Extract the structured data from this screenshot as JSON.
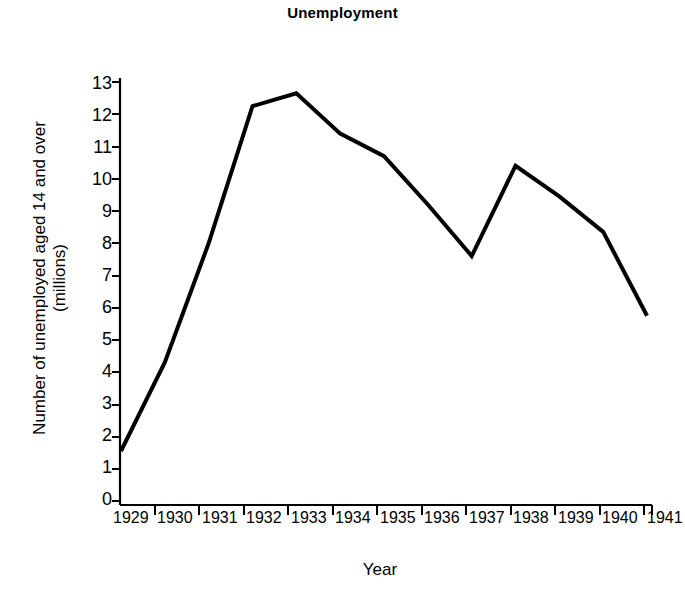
{
  "chart_data": {
    "type": "line",
    "title": "Unemployment",
    "xlabel": "Year",
    "ylabel": "Number of unemployed aged 14 and over (millions)",
    "ylabel_lines": [
      "Number of unemployed aged 14 and over",
      "(millions)"
    ],
    "categories": [
      "1929",
      "1930",
      "1931",
      "1932",
      "1933",
      "1934",
      "1935",
      "1936",
      "1937",
      "1938",
      "1939",
      "1940",
      "1941"
    ],
    "values": [
      1.55,
      4.3,
      8.0,
      12.25,
      12.65,
      11.4,
      10.7,
      9.2,
      7.6,
      10.4,
      9.45,
      8.35,
      5.75
    ],
    "series": [
      {
        "name": "Number of unemployed aged 14 and over (millions)",
        "values": [
          1.55,
          4.3,
          8.0,
          12.25,
          12.65,
          11.4,
          10.7,
          9.2,
          7.6,
          10.4,
          9.45,
          8.35,
          5.75
        ]
      }
    ],
    "ylim": [
      0,
      13
    ],
    "xlim": [
      "1929",
      "1941"
    ],
    "ytick_labels": [
      "0",
      "1",
      "2",
      "3",
      "4",
      "5",
      "6",
      "7",
      "8",
      "9",
      "10",
      "11",
      "12",
      "13"
    ],
    "ytick_values": [
      0,
      1,
      2,
      3,
      4,
      5,
      6,
      7,
      8,
      9,
      10,
      11,
      12,
      13
    ],
    "grid": false,
    "legend": false,
    "legend_position": "none",
    "line_color": "#000000",
    "line_width": 4,
    "axis_color": "#000000",
    "background_color": "#ffffff"
  }
}
